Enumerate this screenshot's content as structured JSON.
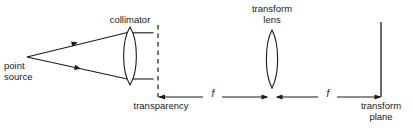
{
  "figure": {
    "type": "optical-ray-diagram",
    "title": "",
    "width": 413,
    "height": 130,
    "background_color": "#ffffff",
    "stroke_color": "#1a1a1a",
    "text_color": "#1a1a1a"
  },
  "labels": {
    "collimator": "collimator",
    "transform_lens_line1": "transform",
    "transform_lens_line2": "lens",
    "point_source_line1": "point",
    "point_source_line2": "source",
    "transparency": "transparency",
    "transform_plane_line1": "transform",
    "transform_plane_line2": "plane",
    "focal_length_1": "f",
    "focal_length_2": "f"
  },
  "elements": [
    {
      "name": "point-source",
      "kind": "point",
      "x": 27,
      "y": 57,
      "label": "point source"
    },
    {
      "name": "diverging-ray-upper",
      "kind": "ray",
      "from": [
        27,
        57
      ],
      "to": [
        127,
        33
      ],
      "direction_marker": "arrow",
      "marker_at": [
        75,
        43
      ]
    },
    {
      "name": "diverging-ray-lower",
      "kind": "ray",
      "from": [
        27,
        57
      ],
      "to": [
        127,
        79
      ],
      "direction_marker": "arrow",
      "marker_at": [
        78,
        69
      ]
    },
    {
      "name": "collimator-lens",
      "kind": "biconvex-lens",
      "center_x": 130,
      "top_y": 27,
      "bottom_y": 85,
      "half_width": 8,
      "label": "collimator"
    },
    {
      "name": "collimated-ray-upper",
      "kind": "ray",
      "from": [
        133,
        33
      ],
      "to": [
        153,
        33
      ]
    },
    {
      "name": "collimated-ray-lower",
      "kind": "ray",
      "from": [
        133,
        79
      ],
      "to": [
        153,
        79
      ]
    },
    {
      "name": "transparency-plane",
      "kind": "dashed-vertical-line",
      "x": 158,
      "top_y": 25,
      "bottom_y": 97,
      "label": "transparency"
    },
    {
      "name": "transform-lens",
      "kind": "biconvex-lens",
      "center_x": 272,
      "top_y": 30,
      "bottom_y": 88,
      "half_width": 7,
      "label": "transform lens"
    },
    {
      "name": "transform-plane",
      "kind": "solid-vertical-line",
      "x": 381,
      "top_y": 22,
      "bottom_y": 97,
      "label": "transform plane"
    }
  ],
  "dimensions": [
    {
      "name": "focal-length-1",
      "label": "f",
      "from_x": 158,
      "to_x": 268,
      "y": 97,
      "arrowheads": "both",
      "spans": "transparency plane to transform lens"
    },
    {
      "name": "focal-length-2",
      "label": "f",
      "from_x": 276,
      "to_x": 381,
      "y": 97,
      "arrowheads": "both",
      "spans": "transform lens to transform plane"
    }
  ]
}
